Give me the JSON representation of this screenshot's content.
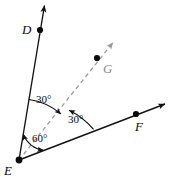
{
  "figure": {
    "type": "geometry-angle-diagram",
    "width": 171,
    "height": 184,
    "background_color": "#ffffff",
    "stroke_color": "#111111",
    "dashed_stroke_color": "#9a9a9a",
    "points": [
      {
        "id": "D",
        "label": "D",
        "x": 40,
        "y": 30,
        "label_x": 22,
        "label_y": 23,
        "style": "solid",
        "dot_color": "#0a0a0a"
      },
      {
        "id": "G",
        "label": "G",
        "x": 97,
        "y": 58,
        "label_x": 103,
        "label_y": 62,
        "style": "dashed",
        "dot_color": "#0a0a0a"
      },
      {
        "id": "F",
        "label": "F",
        "x": 136,
        "y": 114,
        "label_x": 135,
        "label_y": 120,
        "style": "solid",
        "dot_color": "#0a0a0a"
      },
      {
        "id": "E",
        "label": "E",
        "x": 19,
        "y": 160,
        "label_x": 4,
        "label_y": 164,
        "style": "vertex",
        "dot_color": "#0a0a0a"
      }
    ],
    "rays": [
      {
        "id": "ED",
        "from": "E",
        "through": "D",
        "tip_x": 44,
        "tip_y": 4,
        "dashed": false,
        "arrow": true
      },
      {
        "id": "EG",
        "from": "E",
        "through": "G",
        "tip_x": 114,
        "tip_y": 41,
        "dashed": true,
        "arrow": true
      },
      {
        "id": "EF",
        "from": "E",
        "through": "F",
        "tip_x": 166,
        "tip_y": 103,
        "dashed": false,
        "arrow": true
      }
    ],
    "angles": [
      {
        "id": "angle-DEG",
        "value": "30°",
        "between": "ED and EG",
        "label_x": 36,
        "label_y": 94,
        "radius": 62,
        "arrowheads": "end"
      },
      {
        "id": "angle-GEF",
        "value": "30°",
        "between": "EG and EF",
        "label_x": 68,
        "label_y": 114,
        "radius": 80,
        "arrowheads": "end"
      },
      {
        "id": "angle-DEF",
        "value": "60°",
        "between": "ED and EF",
        "label_x": 32,
        "label_y": 133,
        "radius": 26,
        "arrowheads": "both"
      }
    ]
  }
}
